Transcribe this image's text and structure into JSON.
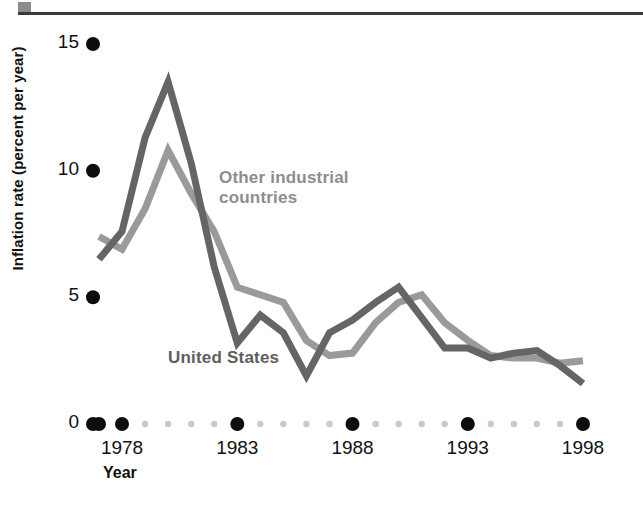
{
  "chart_data": {
    "type": "line",
    "title": "",
    "subtitle": "",
    "xlabel": "Year",
    "ylabel": "Inflation rate (percent per year)",
    "xlim": [
      1977,
      1998
    ],
    "ylim": [
      0,
      15
    ],
    "grid": false,
    "legend_position": "inline-annotation",
    "y_ticks": [
      "15",
      "10",
      "5",
      "0"
    ],
    "y_tick_values": [
      15,
      10,
      5,
      0
    ],
    "x_ticks": [
      "1978",
      "1983",
      "1988",
      "1993",
      "1998"
    ],
    "x_tick_values": [
      1978,
      1983,
      1988,
      1993,
      1998
    ],
    "x": [
      1977,
      1978,
      1979,
      1980,
      1981,
      1982,
      1983,
      1984,
      1985,
      1986,
      1987,
      1988,
      1989,
      1990,
      1991,
      1992,
      1993,
      1994,
      1995,
      1996,
      1997,
      1998
    ],
    "series": [
      {
        "name": "United States",
        "color": "#656565",
        "values": [
          6.5,
          7.6,
          11.3,
          13.5,
          10.3,
          6.2,
          3.2,
          4.3,
          3.6,
          1.9,
          3.6,
          4.1,
          4.8,
          5.4,
          4.2,
          3.0,
          3.0,
          2.6,
          2.8,
          2.9,
          2.3,
          1.6
        ]
      },
      {
        "name": "Other industrial countries",
        "color": "#9a9a9a",
        "values": [
          7.4,
          6.9,
          8.5,
          10.8,
          9.1,
          7.6,
          5.4,
          5.1,
          4.8,
          3.3,
          2.7,
          2.8,
          4.0,
          4.8,
          5.1,
          4.0,
          3.3,
          2.7,
          2.6,
          2.6,
          2.4,
          2.5
        ]
      }
    ],
    "annotations": [
      {
        "text": "Other industrial countries",
        "series": "Other industrial countries",
        "color": "#8d8d8d"
      },
      {
        "text": "United States",
        "series": "United States",
        "color": "#5e5e5e"
      }
    ]
  },
  "axes": {
    "y_title": "Inflation rate (percent per year)",
    "x_title": "Year"
  },
  "labels": {
    "other_industrial_line1": "Other industrial",
    "other_industrial_line2": "countries",
    "united_states": "United States"
  },
  "ticks": {
    "y": [
      {
        "label": "15"
      },
      {
        "label": "10"
      },
      {
        "label": "5"
      },
      {
        "label": "0"
      }
    ],
    "x": [
      {
        "label": "1978"
      },
      {
        "label": "1983"
      },
      {
        "label": "1988"
      },
      {
        "label": "1993"
      },
      {
        "label": "1998"
      }
    ]
  },
  "colors": {
    "united_states": "#656565",
    "other_industrial": "#9a9a9a",
    "tick_dot": "#0d0d0d",
    "minor_dot": "#c9c9c9",
    "rule": "#3a3a3a",
    "corner_square": "#8b8b8b"
  }
}
